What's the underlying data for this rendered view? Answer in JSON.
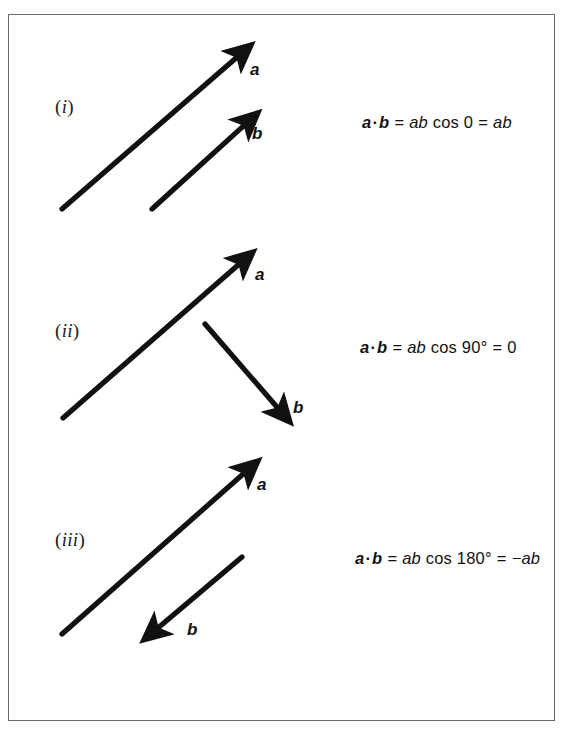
{
  "figure": {
    "background_color": "#ffffff",
    "ink_color": "#111111",
    "frame_color": "#6a6a6a"
  },
  "panels": [
    {
      "id": "i",
      "label": "(i)",
      "label_open": "(",
      "label_roman": "i",
      "label_close": ")",
      "angle_description": "vectors a and b parallel, angle 0",
      "vectors": [
        {
          "name": "a",
          "label": "a",
          "start": {
            "x": 62,
            "y": 209
          },
          "end": {
            "x": 243,
            "y": 52
          }
        },
        {
          "name": "b",
          "label": "b",
          "start": {
            "x": 152,
            "y": 209
          },
          "end": {
            "x": 250,
            "y": 120
          }
        }
      ],
      "equation": {
        "lhs_vec_a": "a",
        "dot": "·",
        "lhs_vec_b": "b",
        "equals_1": "=",
        "magnitude": "ab",
        "cos": "cos",
        "angle": "0",
        "degree_symbol": "",
        "equals_2": "=",
        "rhs": "ab",
        "plain_text": "a·b = ab cos 0 = ab"
      }
    },
    {
      "id": "ii",
      "label": "(ii)",
      "label_open": "(",
      "label_roman": "ii",
      "label_close": ")",
      "angle_description": "vectors a and b perpendicular, angle 90 degrees",
      "vectors": [
        {
          "name": "a",
          "label": "a",
          "start": {
            "x": 63,
            "y": 418
          },
          "end": {
            "x": 245,
            "y": 259
          }
        },
        {
          "name": "b",
          "label": "b",
          "start": {
            "x": 205,
            "y": 324
          },
          "end": {
            "x": 283,
            "y": 414
          }
        }
      ],
      "equation": {
        "lhs_vec_a": "a",
        "dot": "·",
        "lhs_vec_b": "b",
        "equals_1": "=",
        "magnitude": "ab",
        "cos": "cos",
        "angle": "90",
        "degree_symbol": "°",
        "equals_2": "=",
        "rhs": "0",
        "plain_text": "a·b = ab cos 90° = 0"
      }
    },
    {
      "id": "iii",
      "label": "(iii)",
      "label_open": "(",
      "label_roman": "iii",
      "label_close": ")",
      "angle_description": "vectors a and b antiparallel, angle 180 degrees",
      "vectors": [
        {
          "name": "a",
          "label": "a",
          "start": {
            "x": 62,
            "y": 634
          },
          "end": {
            "x": 250,
            "y": 468
          }
        },
        {
          "name": "b",
          "label": "b",
          "start": {
            "x": 242,
            "y": 557
          },
          "end": {
            "x": 152,
            "y": 633
          }
        }
      ],
      "equation": {
        "lhs_vec_a": "a",
        "dot": "·",
        "lhs_vec_b": "b",
        "equals_1": "=",
        "magnitude": "ab",
        "cos": "cos",
        "angle": "180",
        "degree_symbol": "°",
        "equals_2": "=",
        "rhs": "−ab",
        "plain_text": "a·b = ab cos 180° = −ab"
      }
    }
  ]
}
